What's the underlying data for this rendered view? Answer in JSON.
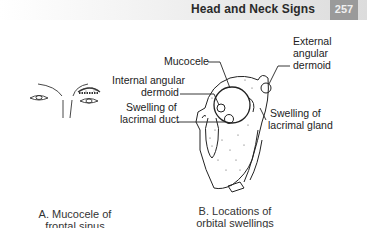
{
  "header": {
    "section_title": "Head and Neck Signs",
    "page_number": "257"
  },
  "figure_a": {
    "caption_line1": "A. Mucocele of",
    "caption_line2": "frontal sinus"
  },
  "figure_b": {
    "caption_line1": "B. Locations of",
    "caption_line2": "orbital swellings",
    "labels": {
      "mucocele": "Mucocele",
      "internal_angular_line1": "Internal angular",
      "internal_angular_line2": "dermoid",
      "lacrimal_duct_line1": "Swelling of",
      "lacrimal_duct_line2": "lacrimal duct",
      "external_angular_line1": "External",
      "external_angular_line2": "angular",
      "external_angular_line3": "dermoid",
      "lacrimal_gland_line1": "Swelling of",
      "lacrimal_gland_line2": "lacrimal gland"
    }
  }
}
